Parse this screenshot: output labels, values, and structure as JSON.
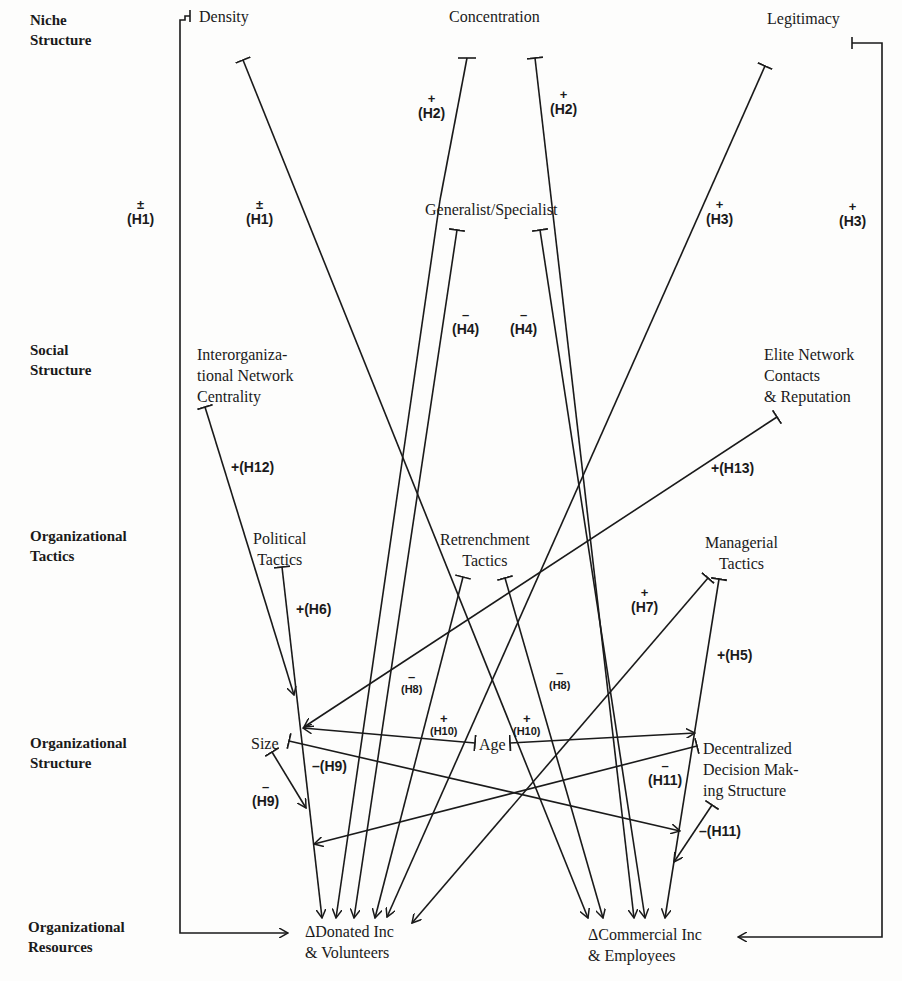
{
  "row_labels": [
    {
      "id": "niche",
      "text": "Niche\nStructure",
      "x": 30,
      "y": 8
    },
    {
      "id": "social",
      "text": "Social\nStructure",
      "x": 30,
      "y": 340
    },
    {
      "id": "tactics",
      "text": "Organizational\nTactics",
      "x": 30,
      "y": 527
    },
    {
      "id": "orgstruct",
      "text": "Organizational\nStructure",
      "x": 30,
      "y": 732
    },
    {
      "id": "resources",
      "text": "Organizational\nResources",
      "x": 30,
      "y": 918
    }
  ],
  "nodes": {
    "density": "Density",
    "concentration": "Concentration",
    "legitimacy": "Legitimacy",
    "generalist": "Generalist/Specialist",
    "interorg": "Interorganiza-\ntional Network\nCentrality",
    "elite": "Elite Network\nContacts\n& Reputation",
    "political": "Political\nTactics",
    "retrenchment": "Retrenchment\nTactics",
    "managerial": "Managerial\nTactics",
    "size": "Size",
    "age": "Age",
    "decentralized": "Decentralized\nDecision Mak-\ning Structure",
    "donated": "ΔDonated Inc\n& Volunteers",
    "commercial": "ΔCommercial Inc\n& Employees"
  },
  "hypotheses": {
    "h1_left": {
      "sign": "±",
      "label": "(H1)"
    },
    "h1_right": {
      "sign": "±",
      "label": "(H1)"
    },
    "h2_left": {
      "sign": "+",
      "label": "(H2)"
    },
    "h2_right": {
      "sign": "+",
      "label": "(H2)"
    },
    "h3_left": {
      "sign": "+",
      "label": "(H3)"
    },
    "h3_right": {
      "sign": "+",
      "label": "(H3)"
    },
    "h4_left": {
      "sign": "–",
      "label": "(H4)"
    },
    "h4_right": {
      "sign": "–",
      "label": "(H4)"
    },
    "h12": "+(H12)",
    "h13": "+(H13)",
    "h6": "+(H6)",
    "h7": {
      "sign": "+",
      "label": "(H7)"
    },
    "h5": "+(H5)",
    "h8_left": {
      "sign": "–",
      "label": "(H8)"
    },
    "h8_right": {
      "sign": "–",
      "label": "(H8)"
    },
    "h10_left": {
      "sign": "+",
      "label": "(H10)"
    },
    "h10_right": {
      "sign": "+",
      "label": "(H10)"
    },
    "h9_minus": "–(H9)",
    "h9_bottom": {
      "sign": "–",
      "label": "(H9)"
    },
    "h11_top": {
      "sign": "–",
      "label": "(H11)"
    },
    "h11_bottom": "–(H11)"
  }
}
